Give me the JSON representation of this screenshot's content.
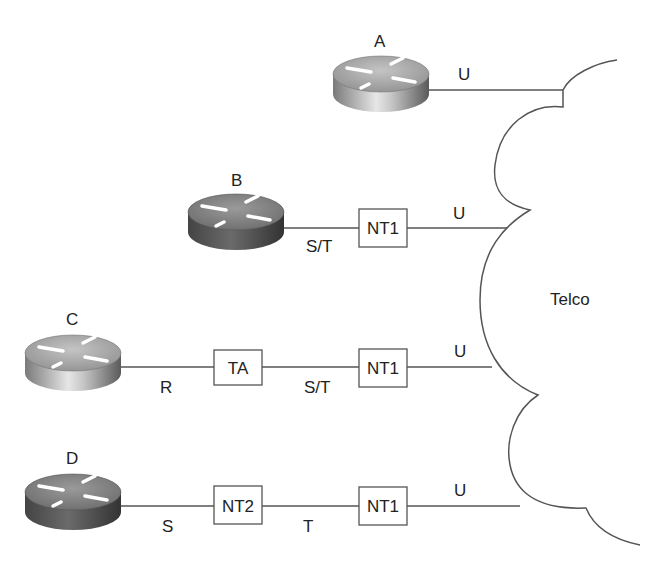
{
  "diagram": {
    "cloud_label": "Telco",
    "routers": [
      {
        "id": "A",
        "label": "A",
        "shade": "light"
      },
      {
        "id": "B",
        "label": "B",
        "shade": "dark"
      },
      {
        "id": "C",
        "label": "C",
        "shade": "light"
      },
      {
        "id": "D",
        "label": "D",
        "shade": "dark"
      }
    ],
    "devices": {
      "b_nt1": "NT1",
      "c_ta": "TA",
      "c_nt1": "NT1",
      "d_nt2": "NT2",
      "d_nt1": "NT1"
    },
    "reference_points": {
      "a_u": "U",
      "b_st": "S/T",
      "b_u": "U",
      "c_r": "R",
      "c_st": "S/T",
      "c_u": "U",
      "d_s": "S",
      "d_t": "T",
      "d_u": "U"
    },
    "colors": {
      "line": "#555555",
      "router_light_top": "#b8b8b8",
      "router_dark_top": "#8a8a8a"
    }
  }
}
